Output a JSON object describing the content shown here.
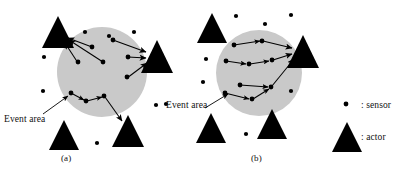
{
  "figure": {
    "type": "diagram",
    "background_color": "#ffffff",
    "ink_color": "#000000",
    "event_area_fill": "#c9c9c9",
    "width": 410,
    "height": 174
  },
  "panels": [
    {
      "id": "a",
      "caption": "(a)",
      "event_area_label": "Event area",
      "event_area": {
        "cx": 102,
        "cy": 72,
        "r": 45
      },
      "pointer": {
        "x1": 44,
        "y1": 112,
        "x2": 68,
        "y2": 96
      },
      "actors": [
        {
          "name": "actor-top-left",
          "cx": 58,
          "cy": 33,
          "w": 30,
          "h": 32
        },
        {
          "name": "actor-right",
          "cx": 157,
          "cy": 57,
          "w": 30,
          "h": 32
        },
        {
          "name": "actor-bottom-right",
          "cx": 128,
          "cy": 131,
          "w": 30,
          "h": 32
        },
        {
          "name": "actor-bottom-left",
          "cx": 64,
          "cy": 135,
          "w": 28,
          "h": 30
        }
      ],
      "sensors_inside": [
        {
          "cx": 92,
          "cy": 47
        },
        {
          "cx": 113,
          "cy": 40
        },
        {
          "cx": 78,
          "cy": 62
        },
        {
          "cx": 103,
          "cy": 62
        },
        {
          "cx": 128,
          "cy": 57
        },
        {
          "cx": 127,
          "cy": 77
        },
        {
          "cx": 71,
          "cy": 93
        },
        {
          "cx": 104,
          "cy": 96
        },
        {
          "cx": 86,
          "cy": 101
        }
      ],
      "sensors_outside": [
        {
          "cx": 85,
          "cy": 32
        },
        {
          "cx": 109,
          "cy": 36
        },
        {
          "cx": 134,
          "cy": 32
        },
        {
          "cx": 44,
          "cy": 57
        },
        {
          "cx": 43,
          "cy": 91
        },
        {
          "cx": 97,
          "cy": 143
        },
        {
          "cx": 156,
          "cy": 105
        }
      ],
      "flows": [
        {
          "from": "sensor",
          "to": "actor-top-left",
          "path": [
            [
              92,
              47
            ],
            [
              66,
              38
            ]
          ]
        },
        {
          "from": "sensor",
          "to": "actor-top-left",
          "path": [
            [
              103,
              62
            ],
            [
              66,
              38
            ]
          ]
        },
        {
          "from": "sensor",
          "to": "actor-top-left",
          "path": [
            [
              78,
              62
            ],
            [
              66,
              40
            ]
          ]
        },
        {
          "from": "sensor",
          "to": "actor-right",
          "path": [
            [
              113,
              40
            ],
            [
              148,
              53
            ]
          ]
        },
        {
          "from": "sensor",
          "to": "actor-right",
          "path": [
            [
              128,
              57
            ],
            [
              148,
              58
            ]
          ]
        },
        {
          "from": "sensor",
          "to": "actor-right",
          "path": [
            [
              127,
              77
            ],
            [
              148,
              62
            ]
          ]
        },
        {
          "from": "sensor",
          "to": "actor-bottom-right",
          "path": [
            [
              71,
              93
            ],
            [
              86,
              101
            ]
          ]
        },
        {
          "from": "sensor",
          "to": "actor-bottom-right",
          "path": [
            [
              86,
              101
            ],
            [
              104,
              96
            ]
          ]
        },
        {
          "from": "sensor",
          "to": "actor-bottom-right",
          "path": [
            [
              104,
              96
            ],
            [
              122,
              120
            ]
          ]
        }
      ]
    },
    {
      "id": "b",
      "caption": "(b)",
      "event_area_label": "Event area",
      "event_area": {
        "cx": 259,
        "cy": 73,
        "r": 43
      },
      "pointer": {
        "x1": 205,
        "y1": 108,
        "x2": 228,
        "y2": 95
      },
      "actors": [
        {
          "name": "actor-top-left",
          "cx": 212,
          "cy": 28,
          "w": 28,
          "h": 30
        },
        {
          "name": "actor-right",
          "cx": 303,
          "cy": 52,
          "w": 30,
          "h": 32
        },
        {
          "name": "actor-bottom-left",
          "cx": 211,
          "cy": 128,
          "w": 28,
          "h": 30
        },
        {
          "name": "actor-bottom-mid",
          "cx": 272,
          "cy": 124,
          "w": 28,
          "h": 30
        },
        {
          "name": "actor-bottom-right",
          "cx": 307,
          "cy": 117,
          "w": 28,
          "h": 30
        }
      ],
      "sensors_inside": [
        {
          "cx": 234,
          "cy": 45
        },
        {
          "cx": 262,
          "cy": 41
        },
        {
          "cx": 226,
          "cy": 61
        },
        {
          "cx": 249,
          "cy": 64
        },
        {
          "cx": 272,
          "cy": 60
        },
        {
          "cx": 240,
          "cy": 85
        },
        {
          "cx": 271,
          "cy": 87
        },
        {
          "cx": 225,
          "cy": 93
        },
        {
          "cx": 252,
          "cy": 99
        }
      ],
      "sensors_outside": [
        {
          "cx": 236,
          "cy": 16
        },
        {
          "cx": 265,
          "cy": 24
        },
        {
          "cx": 291,
          "cy": 15
        },
        {
          "cx": 206,
          "cy": 59
        },
        {
          "cx": 203,
          "cy": 82
        },
        {
          "cx": 291,
          "cy": 91
        },
        {
          "cx": 247,
          "cy": 134
        },
        {
          "cx": 246,
          "cy": 106
        }
      ],
      "flows": [
        {
          "chain": [
            [
              234,
              45
            ],
            [
              262,
              41
            ],
            [
              294,
              48
            ]
          ]
        },
        {
          "chain": [
            [
              226,
              61
            ],
            [
              249,
              64
            ],
            [
              272,
              60
            ],
            [
              294,
              53
            ]
          ]
        },
        {
          "chain": [
            [
              240,
              85
            ],
            [
              271,
              87
            ]
          ]
        },
        {
          "chain": [
            [
              225,
              93
            ],
            [
              252,
              99
            ],
            [
              271,
              87
            ],
            [
              296,
              58
            ]
          ]
        }
      ]
    }
  ],
  "legend": {
    "items": [
      {
        "symbol": "sensor-dot",
        "label": ": sensor"
      },
      {
        "symbol": "actor-triangle",
        "label": ": actor"
      }
    ]
  }
}
